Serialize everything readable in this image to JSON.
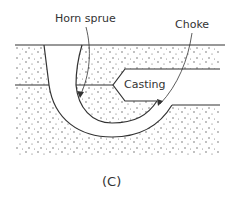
{
  "diagram": {
    "labels": {
      "horn_sprue": "Horn sprue",
      "choke": "Choke",
      "casting": "Casting"
    },
    "caption": "(C)",
    "colors": {
      "line": "#333333",
      "stipple": "#555555",
      "background": "#ffffff"
    }
  }
}
